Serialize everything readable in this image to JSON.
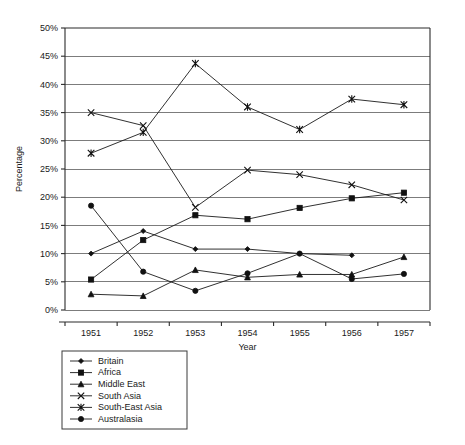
{
  "chart_data": {
    "type": "line",
    "title": "",
    "xlabel": "Year",
    "ylabel": "Percentage",
    "categories": [
      "1951",
      "1952",
      "1953",
      "1954",
      "1955",
      "1956",
      "1957"
    ],
    "x": [
      1951,
      1952,
      1953,
      1954,
      1955,
      1956,
      1957
    ],
    "ylim": [
      0,
      50
    ],
    "ytick_labels": [
      "0%",
      "5%",
      "10%",
      "15%",
      "20%",
      "25%",
      "30%",
      "35%",
      "40%",
      "45%",
      "50%"
    ],
    "ytick_values": [
      0,
      5,
      10,
      15,
      20,
      25,
      30,
      35,
      40,
      45,
      50
    ],
    "grid": "horizontal",
    "legend_position": "below-left",
    "series": [
      {
        "name": "Britain",
        "marker": "diamond",
        "values": [
          10.0,
          14.0,
          10.8,
          10.8,
          10.0,
          9.7,
          null
        ]
      },
      {
        "name": "Africa",
        "marker": "square",
        "values": [
          5.4,
          12.4,
          16.8,
          16.1,
          18.1,
          19.8,
          20.8
        ]
      },
      {
        "name": "Middle East",
        "marker": "triangle",
        "values": [
          2.8,
          2.5,
          7.1,
          5.8,
          6.3,
          6.3,
          9.4
        ]
      },
      {
        "name": "South Asia",
        "marker": "cross",
        "values": [
          35.0,
          32.7,
          18.2,
          24.8,
          24.0,
          22.2,
          19.5
        ]
      },
      {
        "name": "South-East Asia",
        "marker": "star",
        "values": [
          27.8,
          31.5,
          43.7,
          36.0,
          32.0,
          37.4,
          36.4
        ]
      },
      {
        "name": "Australasia",
        "marker": "circle",
        "values": [
          18.5,
          6.8,
          3.4,
          6.5,
          10.0,
          5.5,
          6.4
        ]
      }
    ]
  },
  "legend": {
    "items": [
      {
        "label": "Britain"
      },
      {
        "label": "Africa"
      },
      {
        "label": "Middle East"
      },
      {
        "label": "South Asia"
      },
      {
        "label": "South-East Asia"
      },
      {
        "label": "Australasia"
      }
    ]
  },
  "colors": {
    "series": "#111111",
    "grid": "#6e6e6e",
    "axis": "#2b2b2b",
    "background": "#ffffff"
  }
}
